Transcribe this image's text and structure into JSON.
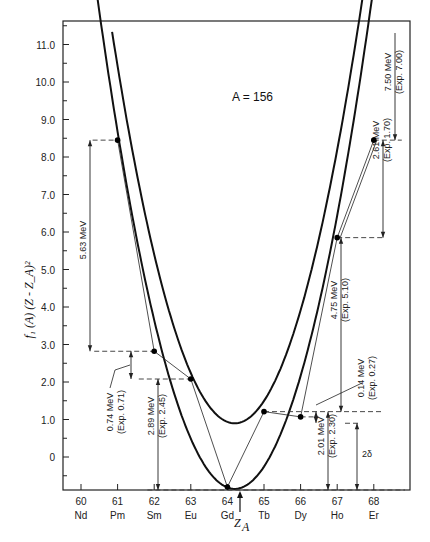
{
  "chart_data": {
    "type": "line",
    "title": "A = 156",
    "xlabel": "Z_A",
    "ylabel": "f1(A)(Z - Z_A)^2",
    "x_ticks": [
      60,
      61,
      62,
      63,
      64,
      65,
      66,
      67,
      68
    ],
    "x_element_labels": [
      "Nd",
      "Pm",
      "Sm",
      "Eu",
      "Gd",
      "Tb",
      "Dy",
      "Ho",
      "Er"
    ],
    "y_ticks": [
      "0",
      "1.0",
      "2.0",
      "3.0",
      "4.0",
      "5.0",
      "6.0",
      "7.0",
      "8.0",
      "9.0",
      "10.0",
      "11.0"
    ],
    "ylim": [
      -1.0,
      11.6
    ],
    "xlim": [
      59.5,
      69.0
    ],
    "z_a_marker": 64.2,
    "grid": false,
    "series": [
      {
        "name": "even-even parabola (lower)",
        "vertex_x": 64.2,
        "vertex_y": -0.85,
        "curvature": 0.93
      },
      {
        "name": "odd-odd parabola (upper)",
        "vertex_x": 64.2,
        "vertex_y": 0.9,
        "curvature": 0.93
      }
    ],
    "points": [
      {
        "element": "Pm",
        "z": 61,
        "y": 8.45
      },
      {
        "element": "Sm",
        "z": 62,
        "y": 2.82
      },
      {
        "element": "Eu",
        "z": 63,
        "y": 2.08
      },
      {
        "element": "Gd",
        "z": 64,
        "y": -0.8
      },
      {
        "element": "Tb",
        "z": 65,
        "y": 1.21
      },
      {
        "element": "Dy",
        "z": 66,
        "y": 1.07
      },
      {
        "element": "Ho",
        "z": 67,
        "y": 5.85
      },
      {
        "element": "Er",
        "z": 68,
        "y": 8.45
      }
    ],
    "annotations": [
      {
        "text": "5.63 MeV",
        "between": [
          "Pm",
          "Sm"
        ]
      },
      {
        "text": "0.74 MeV",
        "sub": "(Exp. 0.71)",
        "between": [
          "Sm",
          "Eu"
        ]
      },
      {
        "text": "2.89 MeV",
        "sub": "(Exp. 2.45)",
        "between": [
          "Eu",
          "Gd"
        ]
      },
      {
        "text": "2.01 MeV",
        "sub": "(Exp. 2.30)",
        "between": [
          "Dy",
          "Gd"
        ]
      },
      {
        "text": "0.14 MeV",
        "sub": "(Exp. 0.27)",
        "between": [
          "Tb",
          "Dy"
        ]
      },
      {
        "text": "4.75 MeV",
        "sub": "(Exp. 5.10)",
        "between": [
          "Ho",
          "Tb"
        ]
      },
      {
        "text": "2.61 MeV",
        "sub": "(Exp. 1.70)",
        "between": [
          "Er",
          "Ho"
        ]
      },
      {
        "text": "7.50 MeV",
        "sub": "(Exp. 7.00)",
        "between": [
          "Er",
          "top"
        ]
      },
      {
        "text": "2δ",
        "between": [
          "lower",
          "upper"
        ]
      }
    ]
  },
  "labels": {
    "title": "A = 156",
    "ylabel": "f₁ (A) (Z - Z_A)²",
    "xlabel_main": "Z",
    "xlabel_sub": "A",
    "delta": "2δ"
  }
}
